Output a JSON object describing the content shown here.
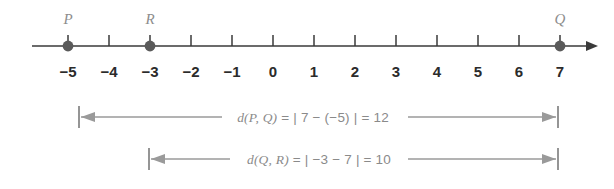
{
  "figure": {
    "background_color": "#ffffff",
    "axis_color": "#3a3a3a",
    "bracket_color": "#9a9a9a",
    "point_label_color": "#8d8d8d",
    "number_color": "#2b2b2b"
  },
  "number_line": {
    "min": -5,
    "max": 7,
    "ticks": [
      {
        "value": -5,
        "label": "−5"
      },
      {
        "value": -4,
        "label": "−4"
      },
      {
        "value": -3,
        "label": "−3"
      },
      {
        "value": -2,
        "label": "−2"
      },
      {
        "value": -1,
        "label": "−1"
      },
      {
        "value": 0,
        "label": "0"
      },
      {
        "value": 1,
        "label": "1"
      },
      {
        "value": 2,
        "label": "2"
      },
      {
        "value": 3,
        "label": "3"
      },
      {
        "value": 4,
        "label": "4"
      },
      {
        "value": 5,
        "label": "5"
      },
      {
        "value": 6,
        "label": "6"
      },
      {
        "value": 7,
        "label": "7"
      }
    ],
    "points": [
      {
        "name": "P",
        "value": -5
      },
      {
        "name": "R",
        "value": -3
      },
      {
        "name": "Q",
        "value": 7
      }
    ]
  },
  "measurements": [
    {
      "id": "d-p-q",
      "expression": "d(P, Q)  =  | 7 − (−5) |  =  12",
      "function_name": "d",
      "arguments": "(P, Q)",
      "absolute_value": "| 7 − (−5) |",
      "result": "12",
      "from_value": -5,
      "to_value": 7
    },
    {
      "id": "d-q-r",
      "expression": "d(Q, R)  =  | −3 − 7 |  =  10",
      "function_name": "d",
      "arguments": "(Q, R)",
      "absolute_value": "| −3 − 7 |",
      "result": "10",
      "from_value": -3,
      "to_value": 7
    }
  ]
}
